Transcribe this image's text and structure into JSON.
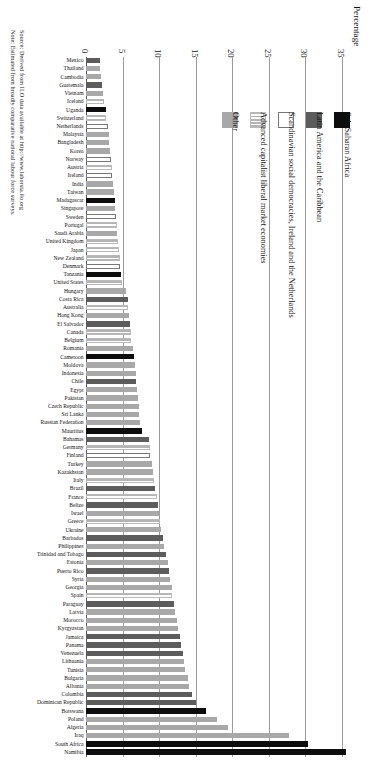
{
  "axis_title": "Percentage",
  "notes": [
    "Source: Derived from ILO data available at http://www.laborsta.ilo.org",
    "Note: Estimated from broadly comparative national labour force surveys."
  ],
  "legend": {
    "position": "upper-right",
    "items": [
      {
        "key": "other",
        "label": "Other",
        "swatch": "solid-medium-gray",
        "color": "#a8a8a8"
      },
      {
        "key": "adv",
        "label": "Advanced capitalist liberal market economies",
        "swatch": "horizontal-stripes",
        "color": "#b4b4b4"
      },
      {
        "key": "scand",
        "label": "Scandinavian social democracies, Ireland and the Netherlands",
        "swatch": "white-outline",
        "color": "#ffffff"
      },
      {
        "key": "latam",
        "label": "Latin America and the Caribbean",
        "swatch": "solid-dark-gray",
        "color": "#5c5c5c"
      },
      {
        "key": "ssa",
        "label": "Sub-Saharan Africa",
        "swatch": "solid-black",
        "color": "#0d0d0d"
      }
    ]
  },
  "chart_data": {
    "type": "bar",
    "orientation": "horizontal",
    "title": "",
    "xlabel": "Percentage",
    "ylabel": "",
    "xlim": [
      0,
      36.5
    ],
    "ticks": [
      0,
      5,
      10,
      15,
      20,
      25,
      30,
      35
    ],
    "grid": true,
    "sorted": "ascending",
    "categories": [
      "Mexico",
      "Thailand",
      "Cambodia",
      "Guatemala",
      "Vietnam",
      "Iceland",
      "Uganda",
      "Switzerland",
      "Netherlands",
      "Malaysia",
      "Bangladesh",
      "Korea",
      "Norway",
      "Austria",
      "Ireland",
      "India",
      "Taiwan",
      "Madagascar",
      "Singapore",
      "Sweden",
      "Portugal",
      "Saudi Arabia",
      "United Kingdom",
      "Japan",
      "New Zealand",
      "Denmark",
      "Tanzania",
      "United States",
      "Hungary",
      "Costa Rica",
      "Australia",
      "Hong Kong",
      "El Salvador",
      "Canada",
      "Belgium",
      "Romania",
      "Cameroon",
      "Moldova",
      "Indonesia",
      "Chile",
      "Egypt",
      "Pakistan",
      "Czech Republic",
      "Sri Lanka",
      "Russian Federation",
      "Mauritius",
      "Bahamas",
      "Germany",
      "Finland",
      "Turkey",
      "Kazakhstan",
      "Italy",
      "Brazil",
      "France",
      "Belize",
      "Israel",
      "Greece",
      "Ukraine",
      "Barbados",
      "Philippines",
      "Trinidad and Tobago",
      "Estonia",
      "Puerto Rico",
      "Syria",
      "Georgia",
      "Spain",
      "Paraguay",
      "Latvia",
      "Morocco",
      "Kyrgyzstan",
      "Jamaica",
      "Panama",
      "Venezuela",
      "Lithuania",
      "Tunisia",
      "Bulgaria",
      "Albania",
      "Colombia",
      "Dominican Republic",
      "Botswana",
      "Poland",
      "Algeria",
      "Iraq",
      "South Africa",
      "Namibia"
    ],
    "values": [
      1.9,
      1.9,
      2.0,
      2.2,
      2.3,
      2.4,
      2.7,
      2.8,
      3.0,
      3.1,
      3.2,
      3.3,
      3.4,
      3.5,
      3.6,
      3.7,
      3.8,
      3.9,
      4.0,
      4.1,
      4.2,
      4.3,
      4.4,
      4.5,
      4.6,
      4.7,
      4.8,
      4.9,
      5.5,
      5.7,
      5.8,
      5.9,
      6.0,
      6.1,
      6.2,
      6.4,
      6.6,
      6.7,
      6.8,
      6.9,
      7.0,
      7.1,
      7.2,
      7.3,
      7.4,
      7.6,
      8.6,
      8.7,
      8.8,
      9.0,
      9.2,
      9.3,
      9.5,
      9.7,
      9.8,
      10.0,
      10.1,
      10.3,
      10.5,
      10.7,
      11.0,
      11.2,
      11.4,
      11.5,
      11.7,
      11.8,
      12.0,
      12.2,
      12.4,
      12.6,
      12.8,
      13.0,
      13.2,
      13.4,
      13.6,
      13.9,
      14.1,
      14.5,
      15.0,
      16.4,
      17.9,
      19.4,
      27.7,
      30.3,
      35.6
    ],
    "groups": [
      "latam",
      "other",
      "other",
      "latam",
      "other",
      "adv",
      "ssa",
      "adv",
      "scand",
      "other",
      "other",
      "other",
      "scand",
      "adv",
      "scand",
      "other",
      "other",
      "ssa",
      "other",
      "scand",
      "adv",
      "other",
      "adv",
      "adv",
      "adv",
      "scand",
      "ssa",
      "adv",
      "other",
      "latam",
      "adv",
      "other",
      "latam",
      "adv",
      "adv",
      "other",
      "ssa",
      "other",
      "other",
      "latam",
      "other",
      "other",
      "other",
      "other",
      "other",
      "ssa",
      "latam",
      "adv",
      "scand",
      "other",
      "other",
      "adv",
      "latam",
      "adv",
      "latam",
      "other",
      "adv",
      "other",
      "latam",
      "other",
      "latam",
      "other",
      "latam",
      "other",
      "other",
      "adv",
      "latam",
      "other",
      "other",
      "other",
      "latam",
      "latam",
      "latam",
      "other",
      "other",
      "other",
      "other",
      "latam",
      "latam",
      "ssa",
      "other",
      "other",
      "other",
      "ssa",
      "ssa"
    ]
  }
}
